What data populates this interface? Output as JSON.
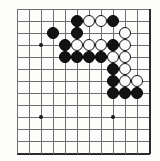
{
  "figure": {
    "board_type": "go-board-partial",
    "background_color": "#fdfdfc",
    "grid_color": "#6e6e6e",
    "edge_color": "#2b2b2b",
    "black_stone_color": "#131313",
    "white_stone_color": "#fbfbfb"
  },
  "board": {
    "origin_x": 17,
    "origin_y": 9,
    "spacing": 12,
    "cols": 12,
    "rows": 13,
    "right_edge_col": 11,
    "bottom_edge_row": 12,
    "star_points": [
      {
        "col": 2,
        "row": 3
      },
      {
        "col": 2,
        "row": 9
      },
      {
        "col": 8,
        "row": 9
      }
    ],
    "stones": [
      {
        "col": 3,
        "row": 2,
        "color": "black"
      },
      {
        "col": 5,
        "row": 1,
        "color": "black"
      },
      {
        "col": 6,
        "row": 1,
        "color": "white"
      },
      {
        "col": 7,
        "row": 1,
        "color": "white"
      },
      {
        "col": 8,
        "row": 1,
        "color": "black"
      },
      {
        "col": 5,
        "row": 2,
        "color": "black"
      },
      {
        "col": 9,
        "row": 2,
        "color": "white"
      },
      {
        "col": 4,
        "row": 3,
        "color": "black"
      },
      {
        "col": 5,
        "row": 3,
        "color": "white"
      },
      {
        "col": 6,
        "row": 3,
        "color": "white"
      },
      {
        "col": 7,
        "row": 3,
        "color": "white"
      },
      {
        "col": 8,
        "row": 3,
        "color": "black"
      },
      {
        "col": 9,
        "row": 3,
        "color": "white"
      },
      {
        "col": 4,
        "row": 4,
        "color": "black"
      },
      {
        "col": 5,
        "row": 4,
        "color": "black"
      },
      {
        "col": 6,
        "row": 4,
        "color": "black"
      },
      {
        "col": 7,
        "row": 4,
        "color": "black"
      },
      {
        "col": 8,
        "row": 4,
        "color": "white"
      },
      {
        "col": 9,
        "row": 4,
        "color": "white"
      },
      {
        "col": 8,
        "row": 5,
        "color": "black"
      },
      {
        "col": 9,
        "row": 5,
        "color": "white"
      },
      {
        "col": 8,
        "row": 6,
        "color": "black"
      },
      {
        "col": 9,
        "row": 6,
        "color": "white"
      },
      {
        "col": 10,
        "row": 6,
        "color": "white"
      },
      {
        "col": 8,
        "row": 7,
        "color": "black"
      },
      {
        "col": 9,
        "row": 7,
        "color": "black"
      },
      {
        "col": 10,
        "row": 7,
        "color": "black"
      }
    ]
  }
}
